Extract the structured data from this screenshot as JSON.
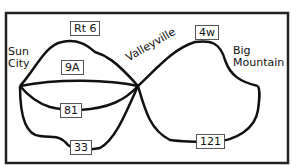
{
  "cities": {
    "sun_city": [
      "Sun",
      "City"
    ],
    "valleyville": "Valleyville",
    "big_mountain": [
      "Big",
      "Mountain"
    ]
  },
  "routes": {
    "rt6": "Rt 6",
    "r9a": "9A",
    "r81": "81",
    "r33": "33",
    "r4w": "4w",
    "r121": "121"
  },
  "colors": {
    "line": "#111111",
    "frame": "#222222",
    "label_border": "#555555"
  }
}
